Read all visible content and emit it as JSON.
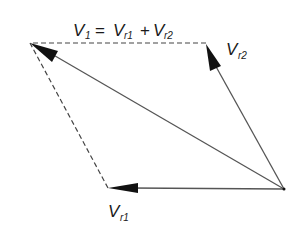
{
  "diagram": {
    "type": "vector-parallelogram",
    "equation": {
      "lhs_main": "V",
      "lhs_sub": "1",
      "equals": "=",
      "term1_main": "V",
      "term1_sub": "r1",
      "plus": "+",
      "term2_main": "V",
      "term2_sub": "r2"
    },
    "labels": {
      "vr2_main": "V",
      "vr2_sub": "r2",
      "vr1_main": "V",
      "vr1_sub": "r1"
    },
    "points": {
      "origin": [
        284,
        189
      ],
      "v1_tip": [
        30,
        43
      ],
      "vr2_tip": [
        206,
        43
      ],
      "vr1_tip": [
        108,
        188
      ]
    },
    "vectors": [
      {
        "name": "V1",
        "from": "origin",
        "to": "v1_tip",
        "style": "solid",
        "arrow": true
      },
      {
        "name": "Vr2",
        "from": "origin",
        "to": "vr2_tip",
        "style": "solid",
        "arrow": true
      },
      {
        "name": "Vr1",
        "from": "origin",
        "to": "vr1_tip",
        "style": "solid",
        "arrow": true
      },
      {
        "name": "dashed-top",
        "from": "vr2_tip",
        "to": "v1_tip",
        "style": "dashed",
        "arrow": false
      },
      {
        "name": "dashed-left",
        "from": "vr1_tip",
        "to": "v1_tip",
        "style": "dashed",
        "arrow": false
      }
    ],
    "colors": {
      "line": "#555555",
      "arrowhead": "#111111",
      "text": "#1a1a1a",
      "background": "#ffffff"
    }
  }
}
